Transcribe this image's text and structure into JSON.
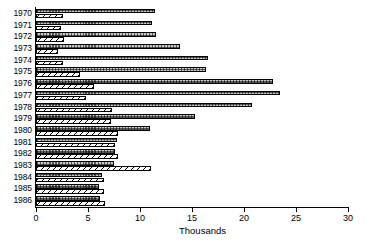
{
  "chart_data": {
    "type": "bar",
    "orientation": "horizontal",
    "title": "",
    "xlabel": "Thousands",
    "ylabel": "",
    "xlim": [
      0,
      30
    ],
    "xticks": [
      0,
      5,
      10,
      15,
      20,
      25,
      30
    ],
    "xtick_labels": [
      "0",
      "5",
      "10",
      "15",
      "20",
      "25",
      "30"
    ],
    "grid": false,
    "legend": "none",
    "categories": [
      "1970",
      "1971",
      "1972",
      "1973",
      "1974",
      "1975",
      "1976",
      "1977",
      "1978",
      "1979",
      "1980",
      "1981",
      "1982",
      "1983",
      "1984",
      "1985",
      "1986"
    ],
    "series": [
      {
        "name": "series-1",
        "pattern": "stippled",
        "values": [
          11.4,
          11.2,
          11.5,
          13.8,
          16.5,
          16.3,
          22.8,
          23.5,
          20.8,
          15.3,
          11.0,
          7.8,
          7.6,
          7.5,
          6.3,
          6.1,
          6.2
        ]
      },
      {
        "name": "series-2",
        "pattern": "diagonal-hatch",
        "values": [
          2.6,
          2.4,
          2.7,
          2.1,
          2.6,
          4.2,
          5.6,
          4.8,
          7.3,
          7.2,
          7.9,
          7.6,
          7.9,
          11.1,
          6.5,
          6.5,
          6.6
        ]
      }
    ]
  },
  "colors": {
    "axis": "#000000",
    "stipple_fill": "#c9c9c9",
    "hatch_fill": "#ffffff",
    "background": "#ffffff"
  }
}
